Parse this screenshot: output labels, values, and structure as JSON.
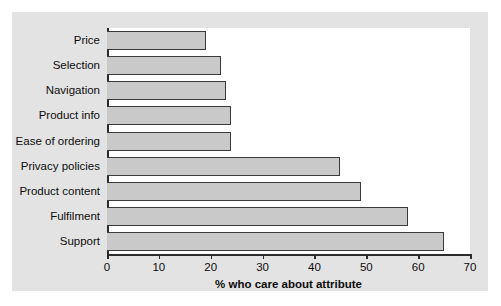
{
  "chart_data": {
    "type": "bar",
    "orientation": "horizontal",
    "title": "",
    "xlabel": "% who care about attribute",
    "ylabel": "",
    "xlim": [
      0,
      70
    ],
    "xticks": [
      0,
      10,
      20,
      30,
      40,
      50,
      60,
      70
    ],
    "grid": false,
    "legend": null,
    "categories": [
      "Price",
      "Selection",
      "Navigation",
      "Product info",
      "Ease of ordering",
      "Privacy policies",
      "Product content",
      "Fulfilment",
      "Support"
    ],
    "values": [
      19,
      22,
      23,
      24,
      24,
      45,
      49,
      58,
      65
    ],
    "colors": {
      "bar_fill": "#c9c9c9",
      "bar_edge": "#3a3a3a",
      "figure_background": "#e3e3e3",
      "plot_background": "#ffffff",
      "axis": "#2b2b2b",
      "text": "#0d0d0d"
    }
  }
}
